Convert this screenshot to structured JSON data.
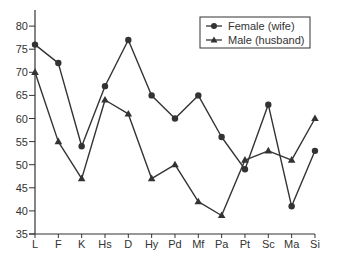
{
  "chart_data": {
    "type": "line",
    "title": "",
    "xlabel": "",
    "ylabel": "",
    "categories": [
      "L",
      "F",
      "K",
      "Hs",
      "D",
      "Hy",
      "Pd",
      "Mf",
      "Pa",
      "Pt",
      "Sc",
      "Ma",
      "Si"
    ],
    "series": [
      {
        "name": "Female (wife)",
        "marker": "circle",
        "values": [
          76,
          72,
          54,
          67,
          77,
          65,
          60,
          65,
          56,
          49,
          63,
          41,
          53
        ]
      },
      {
        "name": "Male (husband)",
        "marker": "triangle",
        "values": [
          70,
          55,
          47,
          64,
          61,
          47,
          50,
          42,
          39,
          51,
          53,
          51,
          60
        ]
      }
    ],
    "ylim": [
      35,
      80
    ],
    "yticks": [
      35,
      40,
      45,
      50,
      55,
      60,
      65,
      70,
      75,
      80
    ],
    "grid": false,
    "legend_position": "upper right",
    "colors": {
      "line": "#333333",
      "text": "#333333",
      "background": "#ffffff"
    }
  },
  "legend": {
    "items": [
      {
        "label": "Female (wife)"
      },
      {
        "label": "Male (husband)"
      }
    ]
  }
}
